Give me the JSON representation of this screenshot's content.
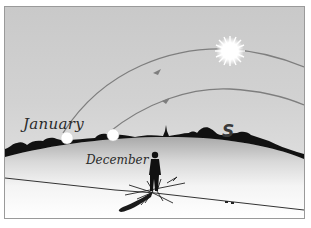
{
  "figure": {
    "type": "illustration",
    "labels": {
      "january": "January",
      "december": "December",
      "south": "S"
    },
    "elements": {
      "sun_icon": "sun-icon",
      "january_sun_arc": "january-sun-path",
      "december_sun_arc": "december-sun-path",
      "horizon": "treeline-silhouette",
      "observer": "standing-person",
      "compass": "compass-rose"
    },
    "colors": {
      "sky": "#cfcfcf",
      "silhouette": "#111111",
      "arc": "#7a7a7a",
      "ground": "#f2f2f2",
      "sun": "#ffffff"
    }
  }
}
